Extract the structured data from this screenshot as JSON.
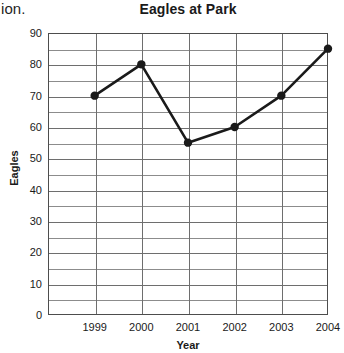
{
  "page": {
    "stray_text": "ion."
  },
  "chart_data": {
    "type": "line",
    "title": "Eagles at Park",
    "xlabel": "Year",
    "ylabel": "Eagles",
    "categories": [
      "1999",
      "2000",
      "2001",
      "2002",
      "2003",
      "2004"
    ],
    "values": [
      70,
      80,
      55,
      60,
      70,
      85
    ],
    "series": [
      {
        "name": "Eagles",
        "values": [
          70,
          80,
          55,
          60,
          70,
          85
        ]
      }
    ],
    "points": [
      {
        "x": "1999",
        "y": 70
      },
      {
        "x": "2000",
        "y": 80
      },
      {
        "x": "2001",
        "y": 55
      },
      {
        "x": "2002",
        "y": 60
      },
      {
        "x": "2003",
        "y": 70
      },
      {
        "x": "2004",
        "y": 85
      }
    ],
    "ylim": [
      0,
      90
    ],
    "y_ticks": [
      0,
      10,
      20,
      30,
      40,
      50,
      60,
      70,
      80,
      90
    ],
    "y_tick_labels": [
      "0",
      "10",
      "20",
      "30",
      "40",
      "50",
      "60",
      "70",
      "80",
      "90"
    ],
    "y_minor_ticks": [
      5,
      15,
      25,
      35,
      45,
      55,
      65,
      75,
      85
    ],
    "x_tick_labels": [
      "1999",
      "2000",
      "2001",
      "2002",
      "2003",
      "2004"
    ],
    "grid": true,
    "legend": false,
    "marker": "circle",
    "line_color": "#1a1a1a",
    "marker_color": "#1a1a1a",
    "grid_color": "#6e6e6e",
    "axis_color": "#4d4d4d"
  }
}
